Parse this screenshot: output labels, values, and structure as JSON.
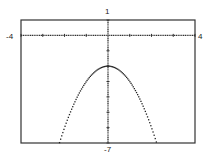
{
  "window": {
    "xmin_label": "-4",
    "xmax_label": "4",
    "ymax_label": "1",
    "ymin_label": "-7"
  },
  "chart_data": {
    "type": "line",
    "title": "",
    "xlabel": "",
    "ylabel": "",
    "xlim": [
      -4,
      4
    ],
    "ylim": [
      -7,
      1
    ],
    "xscale_ticks": 1,
    "yscale_ticks": 1,
    "grid": false,
    "series": [
      {
        "name": "y = -x^2 - 2",
        "style": "dotted",
        "x": [
          -2.24,
          -2,
          -1.5,
          -1,
          -0.5,
          0,
          0.5,
          1,
          1.5,
          2,
          2.24
        ],
        "y": [
          -7,
          -6,
          -4.25,
          -3,
          -2.25,
          -2,
          -2.25,
          -3,
          -4.25,
          -6,
          -7
        ]
      }
    ]
  }
}
